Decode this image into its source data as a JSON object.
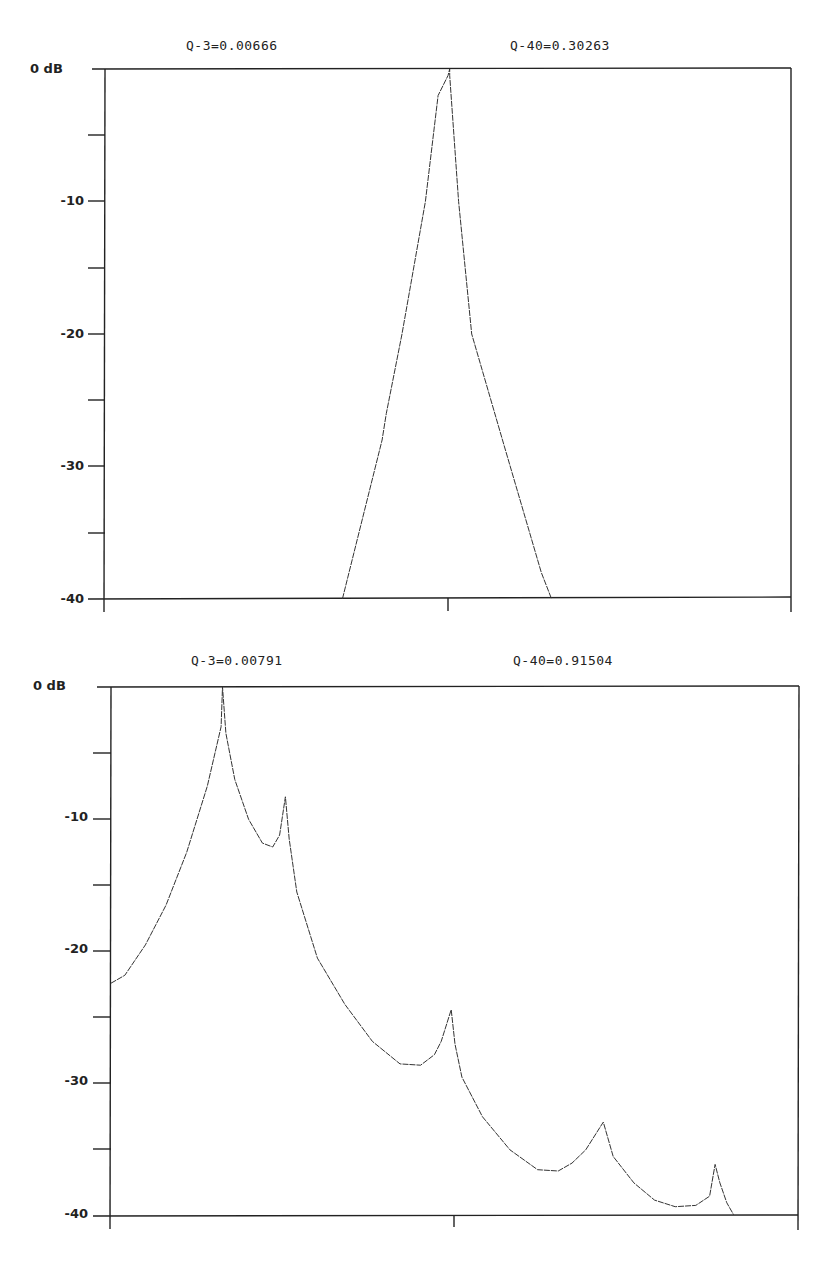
{
  "chart_data": [
    {
      "type": "line",
      "title": "",
      "annotations": [
        "Q-3=0.00666",
        "Q-40=0.30263"
      ],
      "xlabel": "",
      "ylabel": "dB",
      "ylim": [
        -40,
        0
      ],
      "y_ticks_major": [
        0,
        -10,
        -20,
        -30,
        -40
      ],
      "y_tick_labels": [
        "0  dB",
        "-10",
        "-20",
        "-30",
        "-40"
      ],
      "y_ticks_minor": [
        -5,
        -15,
        -25,
        -35
      ],
      "x_ticks": [
        "center"
      ],
      "grid": false,
      "legend": "none",
      "series": [
        {
          "name": "response",
          "x_fraction": [
            0.346,
            0.404,
            0.41,
            0.433,
            0.467,
            0.4855,
            0.5,
            0.5025,
            0.5025,
            0.5155,
            0.5345,
            0.5795,
            0.636,
            0.651
          ],
          "values": [
            -40,
            -28,
            -26,
            -20,
            -10,
            -2,
            -0.5,
            0,
            -0.5,
            -10,
            -20,
            -28,
            -38,
            -40
          ]
        }
      ]
    },
    {
      "type": "line",
      "title": "",
      "annotations": [
        "Q-3=0.00791",
        "Q-40=0.91504"
      ],
      "xlabel": "",
      "ylabel": "dB",
      "ylim": [
        -40,
        0
      ],
      "y_ticks_major": [
        0,
        -10,
        -20,
        -30,
        -40
      ],
      "y_tick_labels": [
        "0  dB",
        "-10",
        "-20",
        "-30",
        "-40"
      ],
      "y_ticks_minor": [
        -5,
        -15,
        -25,
        -35
      ],
      "x_ticks": [
        "center"
      ],
      "grid": false,
      "legend": "none",
      "series": [
        {
          "name": "response",
          "x_fraction": [
            0.0,
            0.02,
            0.05,
            0.08,
            0.11,
            0.14,
            0.16,
            0.162,
            0.167,
            0.18,
            0.2,
            0.22,
            0.235,
            0.245,
            0.2535,
            0.259,
            0.27,
            0.3,
            0.34,
            0.38,
            0.42,
            0.45,
            0.47,
            0.48,
            0.4945,
            0.5,
            0.51,
            0.54,
            0.58,
            0.62,
            0.65,
            0.67,
            0.69,
            0.7155,
            0.73,
            0.76,
            0.79,
            0.82,
            0.85,
            0.87,
            0.878,
            0.885,
            0.895,
            0.905
          ],
          "values": [
            -22.4,
            -21.8,
            -19.5,
            -16.5,
            -12.5,
            -7.5,
            -3.0,
            0,
            -3.5,
            -7.0,
            -10.0,
            -11.8,
            -12.1,
            -11.2,
            -8.3,
            -11.5,
            -15.5,
            -20.5,
            -24.0,
            -26.8,
            -28.5,
            -28.6,
            -27.8,
            -26.8,
            -24.4,
            -27.0,
            -29.5,
            -32.5,
            -35.0,
            -36.5,
            -36.6,
            -36.0,
            -35.0,
            -32.9,
            -35.5,
            -37.5,
            -38.8,
            -39.3,
            -39.2,
            -38.5,
            -36.1,
            -37.5,
            -39.0,
            -39.9
          ]
        }
      ]
    }
  ],
  "charts": [
    {
      "q3_label": "Q-3=0.00666",
      "q40_label": "Q-40=0.30263",
      "y_labels": [
        "0  dB",
        "-10",
        "-20",
        "-30",
        "-40"
      ]
    },
    {
      "q3_label": "Q-3=0.00791",
      "q40_label": "Q-40=0.91504",
      "y_labels": [
        "0  dB",
        "-10",
        "-20",
        "-30",
        "-40"
      ]
    }
  ],
  "colors": {
    "line": "#222222",
    "background": "#ffffff"
  }
}
